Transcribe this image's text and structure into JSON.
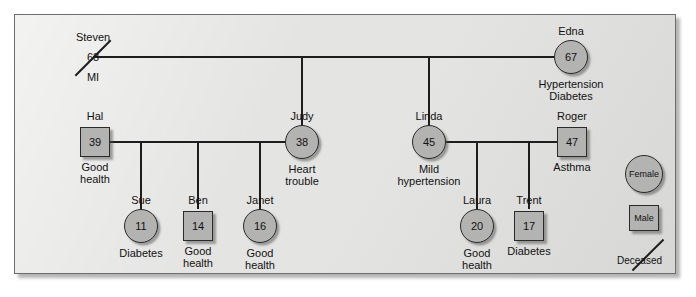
{
  "diagram": {
    "type": "genogram",
    "generations": [
      {
        "id": "gen1",
        "people": [
          {
            "key": "steven",
            "name": "Steven",
            "age": "68",
            "note": "MI",
            "sex": "male",
            "shape": "none",
            "deceased": true
          },
          {
            "key": "edna",
            "name": "Edna",
            "age": "67",
            "note": "Hypertension\nDiabetes",
            "note_line1": "Hypertension",
            "note_line2": "Diabetes",
            "sex": "female",
            "shape": "circle",
            "deceased": false
          }
        ]
      },
      {
        "id": "gen2",
        "people": [
          {
            "key": "hal",
            "name": "Hal",
            "age": "39",
            "note_line1": "Good",
            "note_line2": "health",
            "sex": "male",
            "shape": "square",
            "deceased": false
          },
          {
            "key": "judy",
            "name": "Judy",
            "age": "38",
            "note_line1": "Heart",
            "note_line2": "trouble",
            "sex": "female",
            "shape": "circle",
            "deceased": false
          },
          {
            "key": "linda",
            "name": "Linda",
            "age": "45",
            "note_line1": "Mild",
            "note_line2": "hypertension",
            "sex": "female",
            "shape": "circle",
            "deceased": false
          },
          {
            "key": "roger",
            "name": "Roger",
            "age": "47",
            "note_line1": "Asthma",
            "note_line2": "",
            "sex": "male",
            "shape": "square",
            "deceased": false
          }
        ]
      },
      {
        "id": "gen3",
        "people": [
          {
            "key": "sue",
            "name": "Sue",
            "age": "11",
            "note_line1": "Diabetes",
            "note_line2": "",
            "sex": "female",
            "shape": "circle",
            "deceased": false
          },
          {
            "key": "ben",
            "name": "Ben",
            "age": "14",
            "note_line1": "Good",
            "note_line2": "health",
            "sex": "male",
            "shape": "square",
            "deceased": false
          },
          {
            "key": "janet",
            "name": "Janet",
            "age": "16",
            "note_line1": "Good",
            "note_line2": "health",
            "sex": "female",
            "shape": "circle",
            "deceased": false
          },
          {
            "key": "laura",
            "name": "Laura",
            "age": "20",
            "note_line1": "Good",
            "note_line2": "health",
            "sex": "female",
            "shape": "circle",
            "deceased": false
          },
          {
            "key": "trent",
            "name": "Trent",
            "age": "17",
            "note_line1": "Diabetes",
            "note_line2": "",
            "sex": "male",
            "shape": "square",
            "deceased": false
          }
        ]
      }
    ],
    "legend": {
      "female_label": "Female",
      "male_label": "Male",
      "deceased_label": "Deceased"
    },
    "colors": {
      "panel_background": "#e4e4e2",
      "node_fill": "#b3b3b1",
      "node_border": "#2a2a2a",
      "line": "#1d1d1d",
      "text": "#111111"
    }
  }
}
